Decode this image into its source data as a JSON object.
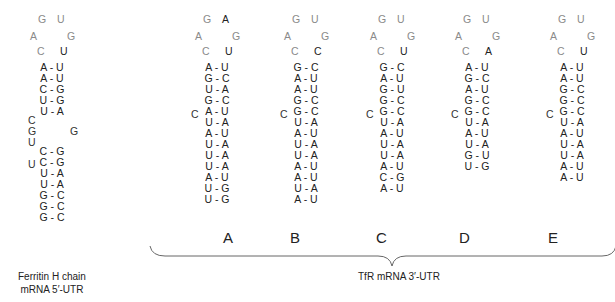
{
  "figure": {
    "ferritin": {
      "loop": {
        "top": [
          "G",
          "U"
        ],
        "middle": [
          "A",
          "G"
        ],
        "bottom": [
          "C",
          "U"
        ]
      },
      "pairs_upper": [
        "A - U",
        "A - U",
        "C - G",
        "U - G",
        "U - A"
      ],
      "bulge_left": [
        "C",
        "G",
        "U"
      ],
      "bulge_right": "G",
      "pairs_lower_bulge": "U",
      "pairs_lower": [
        "C - G",
        "C - G",
        "U - A",
        "U - A",
        "G - C",
        "G - C",
        "G - C"
      ],
      "caption_line1": "Ferritin H chain",
      "caption_line2": "mRNA  5′-UTR"
    },
    "tfr_elements": [
      {
        "label": "A",
        "loop": {
          "top": [
            "G",
            "A"
          ],
          "middle": [
            "A",
            "G"
          ],
          "bottom": [
            "C",
            "U"
          ]
        },
        "pairs_before_bulge": [
          "A - U",
          "G - C",
          "U - A",
          "G - C"
        ],
        "bulge": "C",
        "pairs_after_bulge": [
          "A - U",
          "U - A",
          "A - U",
          "U - A",
          "U - A",
          "U - A",
          "A - U",
          "U - G",
          "U - G"
        ]
      },
      {
        "label": "B",
        "loop": {
          "top": [
            "G",
            "U"
          ],
          "middle": [
            "A",
            "G"
          ],
          "bottom": [
            "C",
            "C"
          ]
        },
        "pairs_before_bulge": [
          "G - C",
          "A - U",
          "A - U",
          "G - C"
        ],
        "bulge": "C",
        "pairs_after_bulge": [
          "G - C",
          "U - A",
          "A - U",
          "U - A",
          "U - A",
          "A - U",
          "A - U",
          "U - A",
          "A - U"
        ]
      },
      {
        "label": "C",
        "loop": {
          "top": [
            "G",
            "U"
          ],
          "middle": [
            "A",
            "G"
          ],
          "bottom": [
            "C",
            "U"
          ]
        },
        "pairs_before_bulge": [
          "G - C",
          "A - U",
          "G - U",
          "G - C"
        ],
        "bulge": "C",
        "pairs_after_bulge": [
          "G - C",
          "U - A",
          "A - U",
          "U - A",
          "U - A",
          "A - U",
          "C - G",
          "A - U"
        ]
      },
      {
        "label": "D",
        "loop": {
          "top": [
            "G",
            "U"
          ],
          "middle": [
            "A",
            "G"
          ],
          "bottom": [
            "C",
            "A"
          ]
        },
        "pairs_before_bulge": [
          "A - U",
          "G - C",
          "A - U",
          "G - C"
        ],
        "bulge": "C",
        "pairs_after_bulge": [
          "G - C",
          "U - A",
          "A - U",
          "U - A",
          "G - U",
          "U - G"
        ]
      },
      {
        "label": "E",
        "loop": {
          "top": [
            "G",
            "U"
          ],
          "middle": [
            "A",
            "G"
          ],
          "bottom": [
            "C",
            "U"
          ]
        },
        "pairs_before_bulge": [
          "A - U",
          "A - U",
          "G - C",
          "G - C"
        ],
        "bulge": "C",
        "pairs_after_bulge": [
          "G - C",
          "U - A",
          "A - U",
          "U - A",
          "U - A",
          "A - U",
          "A - U"
        ]
      }
    ],
    "tfr_caption": "TfR  mRNA  3′-UTR",
    "colors": {
      "loop": "#8a8a8a",
      "stem": "#222222",
      "brace": "#555555"
    }
  }
}
